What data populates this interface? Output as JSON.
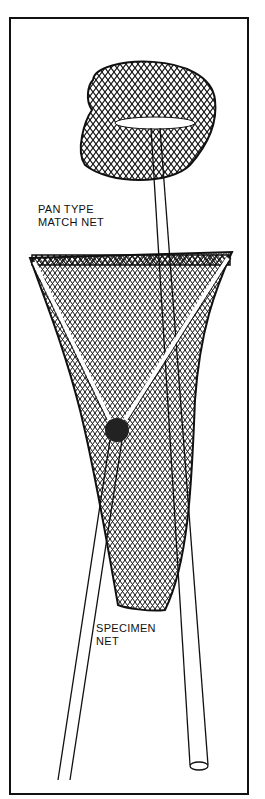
{
  "illustration": {
    "labels": {
      "pan_line1": "PAN TYPE",
      "pan_line2": "MATCH NET",
      "specimen_line1": "SPECIMEN",
      "specimen_line2": "NET"
    },
    "colors": {
      "ink": "#111111",
      "paper": "#ffffff"
    }
  }
}
